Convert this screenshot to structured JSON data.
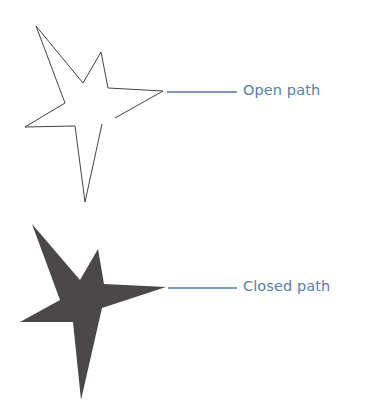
{
  "diagram": {
    "open": {
      "label": "Open path",
      "points": [
        [
          102,
          124
        ],
        [
          85,
          202
        ],
        [
          75,
          126
        ],
        [
          25,
          127
        ],
        [
          65,
          103
        ],
        [
          36,
          26
        ],
        [
          83,
          83
        ],
        [
          101,
          52
        ],
        [
          108,
          88
        ],
        [
          163,
          91
        ],
        [
          115,
          118
        ]
      ],
      "stroke": "#444444",
      "fill": "none",
      "connector": {
        "x1": 167,
        "y1": 92,
        "x2": 237,
        "y2": 92
      }
    },
    "closed": {
      "label": "Closed path",
      "points": [
        [
          32,
          224
        ],
        [
          80,
          280
        ],
        [
          98,
          249
        ],
        [
          104,
          284
        ],
        [
          166,
          287
        ],
        [
          102,
          308
        ],
        [
          81,
          400
        ],
        [
          73,
          322
        ],
        [
          20,
          322
        ],
        [
          60,
          300
        ]
      ],
      "fill": "#4a4849",
      "connector": {
        "x1": 168,
        "y1": 288,
        "x2": 237,
        "y2": 288
      }
    },
    "connector_color": "#4f78a8",
    "label_color": "#5a7fa8"
  }
}
